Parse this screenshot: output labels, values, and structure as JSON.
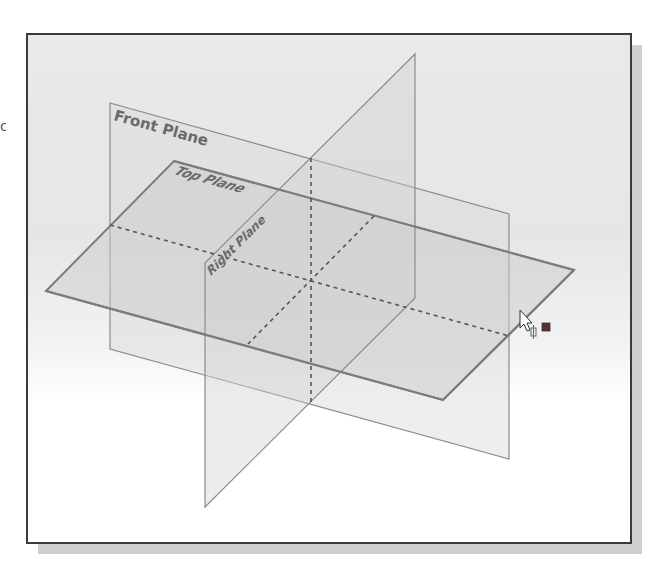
{
  "viewport": {
    "background_top": "#e8e8e8",
    "background_bottom": "#ffffff",
    "border_color": "#3a3a3a"
  },
  "planes": {
    "front": {
      "label": "Front Plane",
      "fill": "#d6d6d6",
      "stroke": "#8a8a8a"
    },
    "top": {
      "label": "Top Plane",
      "fill": "#cfcfcf",
      "stroke": "#7e7e7e"
    },
    "right": {
      "label": "Right Plane",
      "fill": "#d2d2d2",
      "stroke": "#8a8a8a"
    }
  },
  "intersections": {
    "style": "dashed",
    "color": "#555555"
  },
  "cursor": {
    "type": "arrow-with-plane-select",
    "indicator_color": "#6b3a3a"
  },
  "edge_glyph": "c"
}
